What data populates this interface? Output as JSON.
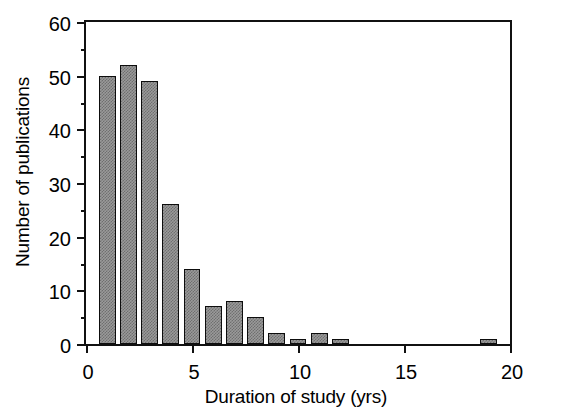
{
  "chart_data": {
    "type": "bar",
    "title": "",
    "subtitle": "",
    "xlabel": "Duration of study (yrs)",
    "ylabel": "Number of publications",
    "xlim": [
      0,
      20
    ],
    "ylim": [
      0,
      60
    ],
    "grid": false,
    "legend": null,
    "bar_width_years": 0.8,
    "x_ticks": [
      {
        "value": 0,
        "label": "0"
      },
      {
        "value": 5,
        "label": "5"
      },
      {
        "value": 10,
        "label": "10"
      },
      {
        "value": 15,
        "label": "15"
      },
      {
        "value": 20,
        "label": "20"
      }
    ],
    "x_minor_ticks": [
      1,
      2,
      3,
      4,
      6,
      7,
      8,
      9,
      11,
      12,
      13,
      14,
      16,
      17,
      18,
      19
    ],
    "y_ticks": [
      {
        "value": 0,
        "label": "0"
      },
      {
        "value": 10,
        "label": "10"
      },
      {
        "value": 20,
        "label": "20"
      },
      {
        "value": 30,
        "label": "30"
      },
      {
        "value": 40,
        "label": "40"
      },
      {
        "value": 50,
        "label": "50"
      },
      {
        "value": 60,
        "label": "60"
      }
    ],
    "bar_fill_color": "#9a9a9a",
    "bar_edge_color": "#0d0d0d",
    "axis_color": "#111111",
    "bin_centers": [
      1,
      2,
      3,
      4,
      5,
      6,
      7,
      8,
      9,
      10,
      11,
      12,
      19
    ],
    "categories": [
      "1",
      "2",
      "3",
      "4",
      "5",
      "6",
      "7",
      "8",
      "9",
      "10",
      "11",
      "12",
      "19"
    ],
    "values": [
      50,
      52,
      49,
      26,
      14,
      7,
      8,
      5,
      2,
      1,
      2,
      1,
      1
    ],
    "bars": [
      {
        "x": 1,
        "value": 50
      },
      {
        "x": 2,
        "value": 52
      },
      {
        "x": 3,
        "value": 49
      },
      {
        "x": 4,
        "value": 26
      },
      {
        "x": 5,
        "value": 14
      },
      {
        "x": 6,
        "value": 7
      },
      {
        "x": 7,
        "value": 8
      },
      {
        "x": 8,
        "value": 5
      },
      {
        "x": 9,
        "value": 2
      },
      {
        "x": 10,
        "value": 1
      },
      {
        "x": 11,
        "value": 2
      },
      {
        "x": 12,
        "value": 1
      },
      {
        "x": 19,
        "value": 1
      }
    ]
  }
}
